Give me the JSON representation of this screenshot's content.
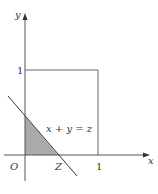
{
  "diagram": {
    "axes": {
      "x_label": "x",
      "y_label": "y",
      "origin_label": "O"
    },
    "ticks": {
      "x_one": "1",
      "y_one": "1",
      "z_label": "Z"
    },
    "line_label": "x + y = z",
    "colors": {
      "axis": "#555555",
      "square": "#666666",
      "shade": "#aaaaaa",
      "line": "#333333"
    }
  }
}
